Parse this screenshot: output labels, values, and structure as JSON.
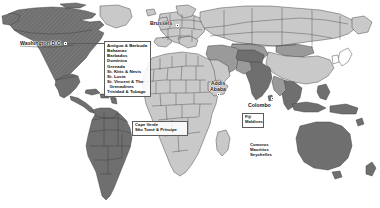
{
  "map": {
    "title": "World map of participating countries",
    "projection": "equirectangular",
    "background_color": "#ffffff",
    "legend_colors": {
      "dark_gray": "#6f6f6f",
      "medium_gray": "#9a9a9a",
      "light_gray": "#c9c9c9",
      "unfilled": "#ffffff",
      "border": "#3d3d3d",
      "box_border": "#5c5c5c",
      "text": "#101010",
      "marker": "#3a3a3a"
    }
  },
  "city_labels": [
    {
      "id": "washington-dc",
      "text": "Washington D.C.",
      "x": 20,
      "y": 42,
      "marker_x": 64,
      "marker_y": 43.5
    },
    {
      "id": "brussels",
      "text": "Brussels",
      "x": 150,
      "y": 22,
      "marker_x": 176,
      "marker_y": 26
    },
    {
      "id": "addis-ababa",
      "text": "Addis Ababa",
      "x": 208,
      "y": 78,
      "marker_x": 221,
      "marker_y": 92
    },
    {
      "id": "colombo",
      "text": "Colombo",
      "x": 248,
      "y": 101,
      "marker_x": 272,
      "marker_y": 98
    }
  ],
  "callouts": [
    {
      "id": "caribbean",
      "x": 104,
      "y": 41,
      "w": 47,
      "h": 41,
      "lines": [
        "Antigua & Barbuda",
        "Bahamas",
        "Barbados",
        "Dominica",
        "Grenada",
        "St. Kitts & Nevis",
        "St. Lucia",
        "St. Vincent & The",
        "  Grenadines",
        "Trinidad & Tobago"
      ]
    },
    {
      "id": "west-africa-islands",
      "x": 132,
      "y": 121,
      "w": 56,
      "h": 12,
      "lines": [
        "Cape Verde",
        "São Tomé & Príncipe"
      ]
    },
    {
      "id": "fiji-maldives",
      "x": 242,
      "y": 113,
      "w": 22,
      "h": 13,
      "lines": [
        "Fiji",
        "Maldives"
      ]
    },
    {
      "id": "indian-ocean-islands",
      "x": 248,
      "y": 142,
      "w": 34,
      "h": 18,
      "lines": [
        "Comoros",
        "Mauritius",
        "Seychelles"
      ],
      "borderless": true
    }
  ]
}
